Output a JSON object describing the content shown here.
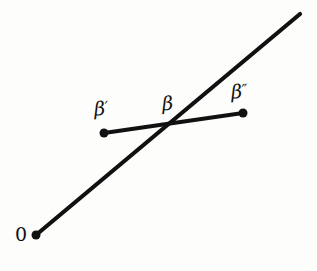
{
  "figure": {
    "background_color": "#fdfdfc",
    "stroke_color": "#111111",
    "width": 317,
    "height": 271
  },
  "labels": {
    "origin": "0",
    "beta_prime": "β",
    "beta_prime_mark": "′",
    "beta": "β",
    "beta_double_prime": "β",
    "beta_double_prime_mark": "″"
  },
  "chart_data": {
    "type": "diagram",
    "title": "",
    "xlabel": "",
    "ylabel": "",
    "xlim": [
      0,
      317
    ],
    "ylim": [
      271,
      0
    ],
    "grid": false,
    "legend": "none",
    "series": [
      {
        "name": "ray-from-origin",
        "kind": "line",
        "points": [
          [
            36,
            235
          ],
          [
            300,
            14
          ]
        ],
        "stroke_width": 4.2,
        "markers": [
          {
            "at": [
              36,
              235
            ],
            "radius": 4.5,
            "filled": true
          }
        ]
      },
      {
        "name": "segment-beta-prime-to-beta-double-prime",
        "kind": "line",
        "points": [
          [
            104,
            133
          ],
          [
            243,
            113
          ]
        ],
        "stroke_width": 4.0,
        "markers": [
          {
            "at": [
              104,
              133
            ],
            "radius": 4.5,
            "filled": true
          },
          {
            "at": [
              243,
              113
            ],
            "radius": 4.5,
            "filled": true
          }
        ]
      }
    ],
    "intersection": {
      "name": "beta",
      "at": [
        176,
        122
      ]
    },
    "annotations": [
      {
        "text": "0",
        "at": [
          16,
          226
        ],
        "anchor": "origin-point"
      },
      {
        "text": "β′",
        "at": [
          94,
          99
        ],
        "anchor": "beta-prime-point"
      },
      {
        "text": "β",
        "at": [
          162,
          95
        ],
        "anchor": "intersection-point"
      },
      {
        "text": "β″",
        "at": [
          231,
          83
        ],
        "anchor": "beta-double-prime-point"
      }
    ]
  }
}
